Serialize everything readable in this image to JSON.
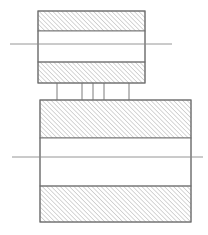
{
  "figure": {
    "canvas": {
      "width": 208,
      "height": 235,
      "background": "#ffffff"
    },
    "colors": {
      "outline": "#6e6e6e",
      "hatch": "#8c8c8c",
      "centerline": "#8a8a8a",
      "void_fill": "#ffffff",
      "background": "#ffffff"
    },
    "hatch": {
      "angle_degrees": 45,
      "direction": "lower-left to upper-right",
      "spacing_px": 3.2,
      "line_width": 0.7
    }
  },
  "upper_block": {
    "name": "upper-block",
    "x": 38,
    "y": 11,
    "width": 107,
    "height": 72,
    "top_band": {
      "y": 11,
      "height": 20
    },
    "void": {
      "y": 31,
      "height": 31
    },
    "bottom_band": {
      "y": 62,
      "height": 21
    },
    "centerline": {
      "y": 44,
      "x_start": 10,
      "x_end": 172
    }
  },
  "lower_block": {
    "name": "lower-block",
    "x": 40,
    "y": 100,
    "width": 151,
    "height": 122,
    "top_band": {
      "y": 100,
      "height": 38
    },
    "void": {
      "y": 138,
      "height": 48
    },
    "bottom_band": {
      "y": 186,
      "height": 36
    },
    "centerline": {
      "y": 157,
      "x_start": 12,
      "x_end": 203
    }
  },
  "pins": {
    "name": "connecting-pins",
    "count": 5,
    "y_top": 83,
    "y_bottom": 100,
    "x_positions": [
      57,
      82,
      93,
      104,
      129
    ]
  }
}
